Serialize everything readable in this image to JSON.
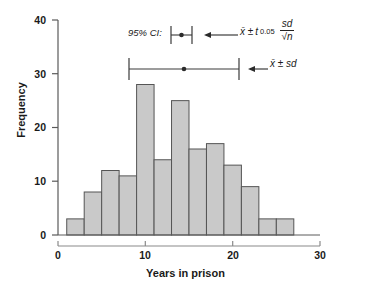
{
  "chart": {
    "type": "bar",
    "xlabel": "Years in prison",
    "ylabel": "Frequency"
  },
  "axes": {
    "y_ticks": [
      "0",
      "10",
      "20",
      "30",
      "40"
    ],
    "x_ticks": [
      "0",
      "10",
      "20",
      "30"
    ]
  },
  "annotations": {
    "ci_label": "95% CI:",
    "ci_formula_mean": "x̄ ± ",
    "ci_formula_t": "t",
    "ci_formula_t_sub": "0.05",
    "ci_formula_num": "sd",
    "ci_formula_den": "√n",
    "sd_formula": "x̄ ± sd"
  },
  "chart_data": {
    "type": "bar",
    "title": "",
    "subtitle": "",
    "xlabel": "Years in prison",
    "ylabel": "Frequency",
    "xlim": [
      0,
      30
    ],
    "ylim": [
      0,
      40
    ],
    "grid": false,
    "legend": "none",
    "bin_width": 2,
    "categories": [
      "1-3",
      "3-5",
      "5-7",
      "7-9",
      "9-11",
      "11-13",
      "13-15",
      "15-17",
      "17-19",
      "19-21",
      "21-23",
      "23-25",
      "25-27"
    ],
    "bin_starts": [
      1,
      3,
      5,
      7,
      9,
      11,
      13,
      15,
      17,
      19,
      21,
      23,
      25
    ],
    "values": [
      3,
      8,
      12,
      11,
      28,
      14,
      25,
      16,
      17,
      13,
      9,
      3,
      3
    ],
    "bar_color": "#c9c9c9",
    "bar_edge_color": "#555555",
    "annotations": [
      {
        "name": "95% CI error bar",
        "label": "95% CI:",
        "formula": "x̄ ± t0.05 · sd/√n",
        "center": 13.0,
        "low": 12.2,
        "high": 13.8,
        "y_value": 36.5
      },
      {
        "name": "standard deviation error bar",
        "label": "",
        "formula": "x̄ ± sd",
        "center": 13.0,
        "low": 7.6,
        "high": 18.4,
        "y_value": 30.0
      }
    ]
  }
}
